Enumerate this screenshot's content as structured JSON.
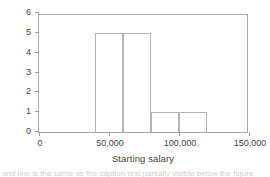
{
  "chart_data": {
    "type": "bar",
    "title": "",
    "subtitle": "",
    "xlabel": "Starting salary",
    "ylabel": "Frequency",
    "xlim": [
      0,
      150000
    ],
    "ylim": [
      0,
      6
    ],
    "grid": false,
    "legend": null,
    "xticks": [
      0,
      50000,
      100000,
      150000
    ],
    "xtick_labels": [
      "0",
      "50,000",
      "100,000",
      "150,000"
    ],
    "yticks": [
      0,
      1,
      2,
      3,
      4,
      5,
      6
    ],
    "ytick_labels": [
      "0",
      "1",
      "2",
      "3",
      "4",
      "5",
      "6"
    ],
    "bin_edges": [
      40000,
      60000,
      80000,
      100000,
      120000
    ],
    "bins": [
      {
        "x0": 40000,
        "x1": 60000,
        "value": 5
      },
      {
        "x0": 60000,
        "x1": 80000,
        "value": 5
      },
      {
        "x0": 80000,
        "x1": 100000,
        "value": 1
      },
      {
        "x0": 100000,
        "x1": 120000,
        "value": 1
      }
    ],
    "categories": [
      "40,000-60,000",
      "60,000-80,000",
      "80,000-100,000",
      "100,000-120,000"
    ],
    "values": [
      5,
      5,
      1,
      1
    ],
    "bar_fill_color": "#ffffff",
    "bar_edge_color": "#b4b4b4",
    "axis_color": "#a8a8a8",
    "text_color": "#3f3f3f",
    "background_color": "#ffffff"
  },
  "caption": {
    "partial_text": "and line is the same as the caption text partially visible below the figure"
  }
}
